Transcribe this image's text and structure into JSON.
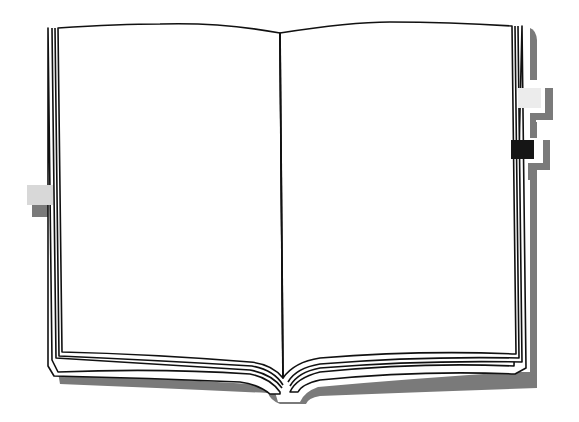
{
  "illustration": {
    "subject": "open blank book",
    "colors": {
      "background": "#ffffff",
      "page": "#ffffff",
      "outline": "#111111",
      "shadow": "#7a7a7a",
      "tab_light": "#d8d8d8",
      "tab_pale": "#ececec",
      "tab_dark": "#151515"
    },
    "bookmarks": [
      {
        "side": "left",
        "shade": "light"
      },
      {
        "side": "right",
        "shade": "pale"
      },
      {
        "side": "right",
        "shade": "dark"
      }
    ]
  }
}
